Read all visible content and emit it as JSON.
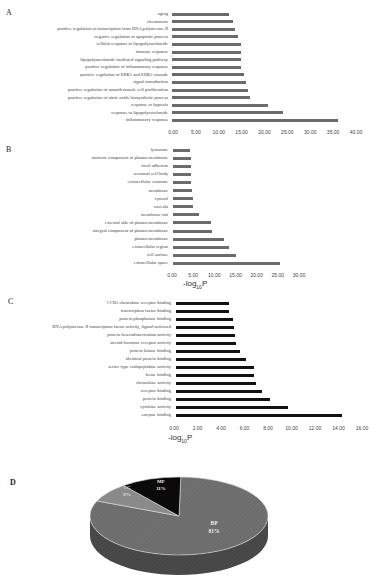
{
  "chart_data": [
    {
      "panel": "A",
      "type": "bar",
      "orientation": "horizontal",
      "title": "",
      "xlabel": "",
      "ylabel": "",
      "xlim": [
        0,
        40
      ],
      "ticks": [
        "0.00",
        "5.00",
        "10.00",
        "15.00",
        "20.00",
        "25.00",
        "30.00",
        "35.00",
        "40.00"
      ],
      "bar_color": "#6b6b6b",
      "categories": [
        "aging",
        "chemotaxis",
        "positive regulation of transcription from RNA polymerase II",
        "negative regulation of apoptotic process",
        "cellular response to lipopolysaccharide",
        "immune response",
        "lipopolysaccharide-mediated signaling pathway",
        "positive regulation of inflammatory response",
        "positive regulation of ERK1 and ERK2 cascade",
        "signal transduction",
        "positive regulation of smooth muscle cell proliferation",
        "positive regulation of nitric oxide biosynthetic process",
        "response to hypoxia",
        "response to lipopolysaccharide",
        "inflammatory response"
      ],
      "values": [
        12.2,
        13.1,
        13.6,
        14.2,
        14.9,
        14.9,
        14.9,
        14.8,
        15.5,
        16.0,
        16.4,
        16.8,
        20.8,
        24.0,
        36.1
      ]
    },
    {
      "panel": "B",
      "type": "bar",
      "orientation": "horizontal",
      "title": "",
      "xlabel": "-log10P",
      "ylabel": "",
      "xlim": [
        0,
        30
      ],
      "ticks": [
        "0.00",
        "5.00",
        "10.00",
        "15.00",
        "20.00",
        "25.00",
        "30.00"
      ],
      "bar_color": "#6b6b6b",
      "categories": [
        "lysosome",
        "intrinsic component of plasma membrane",
        "focal adhesion",
        "neuronal cell body",
        "extracellular exosome",
        "membrane",
        "cytosol",
        "caveola",
        "membrane raft",
        "external side of plasma membrane",
        "integral component of plasma membrane",
        "plasma membrane",
        "extracellular region",
        "cell surface",
        "extracellular space"
      ],
      "values": [
        4.3,
        4.4,
        4.5,
        4.6,
        4.6,
        4.8,
        4.9,
        5.0,
        6.4,
        9.1,
        9.4,
        12.3,
        13.5,
        15.1,
        25.5
      ]
    },
    {
      "panel": "C",
      "type": "bar",
      "orientation": "horizontal",
      "title": "",
      "xlabel": "-log10P",
      "ylabel": "",
      "xlim": [
        0,
        16
      ],
      "ticks": [
        "0.00",
        "2.00",
        "4.00",
        "6.00",
        "8.00",
        "10.00",
        "12.00",
        "14.00",
        "16.00"
      ],
      "bar_color": "#111111",
      "categories": [
        "CCR5 chemokine receptor binding",
        "transcription factor binding",
        "protein phosphatase binding",
        "RNA polymerase II transcription factor activity, ligand-activated",
        "protein heterodimerization activity",
        "steroid hormone receptor activity",
        "protein kinase binding",
        "identical protein binding",
        "serine-type endopeptidase activity",
        "heme binding",
        "chemokine activity",
        "receptor binding",
        "protein binding",
        "cytokine activity",
        "enzyme binding"
      ],
      "values": [
        4.7,
        4.7,
        5.0,
        5.1,
        5.2,
        5.3,
        5.6,
        6.1,
        6.8,
        6.8,
        7.0,
        7.5,
        8.2,
        9.7,
        14.3
      ]
    },
    {
      "panel": "D",
      "type": "pie",
      "style": "3d",
      "title": "",
      "categories": [
        "BP",
        "CC",
        "MF"
      ],
      "values": [
        81,
        8,
        11
      ],
      "labels": [
        "BP\n81%",
        "CC\n8%",
        "MF\n11%"
      ],
      "colors": [
        "#6e6e6e",
        "#8a8a8a",
        "#0a0a0a"
      ]
    }
  ],
  "panels": {
    "a": {
      "letter": "A"
    },
    "b": {
      "letter": "B",
      "xlabel_main": "-log",
      "xlabel_sub": "10",
      "xlabel_end": "P"
    },
    "c": {
      "letter": "C",
      "xlabel_main": "-log",
      "xlabel_sub": "10",
      "xlabel_end": "P"
    },
    "d": {
      "letter": "D",
      "bp_name": "BP",
      "bp_pct": "81%",
      "cc_name": "CC",
      "cc_pct": "8%",
      "mf_name": "MF",
      "mf_pct": "11%"
    }
  }
}
